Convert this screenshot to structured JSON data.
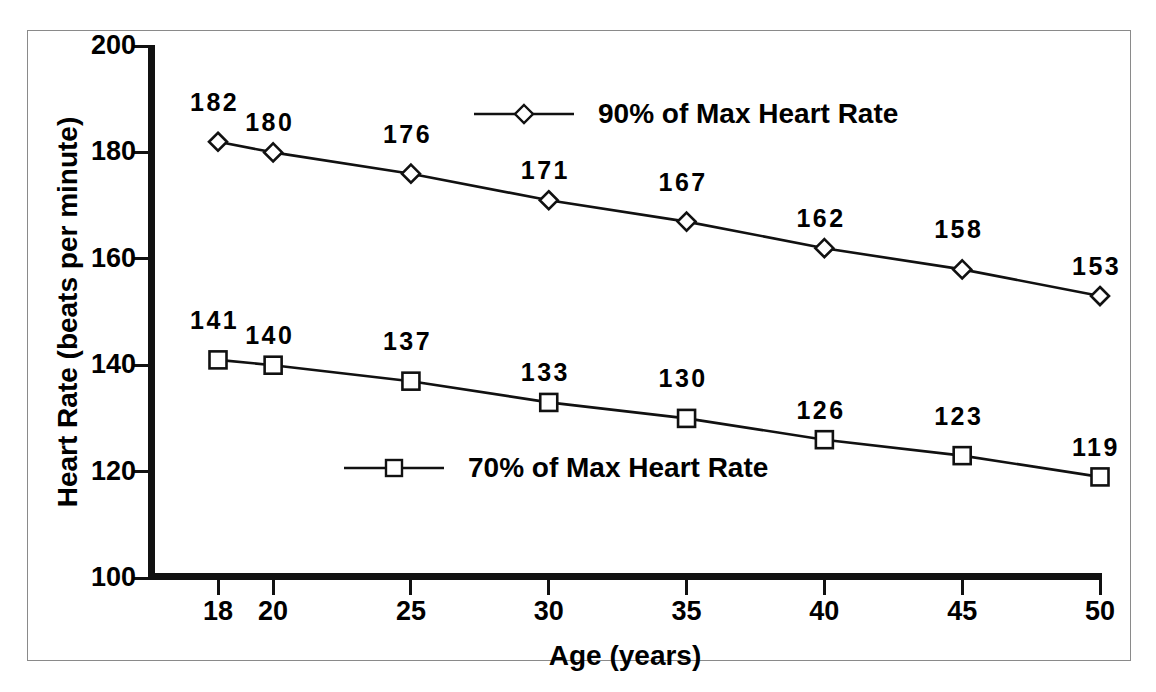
{
  "figure": {
    "cut_off_title": "Target Heart Rate Range",
    "frame_color": "#8a8a8a",
    "ink_color": "#111111"
  },
  "chart_data": {
    "type": "line",
    "title": "",
    "xlabel": "Age (years)",
    "ylabel": "Heart Rate (beats per minute)",
    "x": [
      18,
      20,
      25,
      30,
      35,
      40,
      45,
      50
    ],
    "xtick_labels": [
      "18",
      "20",
      "25",
      "30",
      "35",
      "40",
      "45",
      "50"
    ],
    "ytick_labels": [
      "100",
      "120",
      "140",
      "160",
      "180",
      "200"
    ],
    "yticks": [
      100,
      120,
      140,
      160,
      180,
      200
    ],
    "xlim": [
      17,
      50
    ],
    "ylim": [
      100,
      200
    ],
    "grid": false,
    "legend_position": "inside",
    "series": [
      {
        "name": "90% of Max Heart Rate",
        "marker": "diamond",
        "values": [
          182,
          180,
          176,
          171,
          167,
          162,
          158,
          153
        ],
        "labels": [
          "182",
          "180",
          "176",
          "171",
          "167",
          "162",
          "158",
          "153"
        ]
      },
      {
        "name": "70% of Max Heart Rate",
        "marker": "square",
        "values": [
          141,
          140,
          137,
          133,
          130,
          126,
          123,
          119
        ],
        "labels": [
          "141",
          "140",
          "137",
          "133",
          "130",
          "126",
          "123",
          "119"
        ]
      }
    ]
  }
}
